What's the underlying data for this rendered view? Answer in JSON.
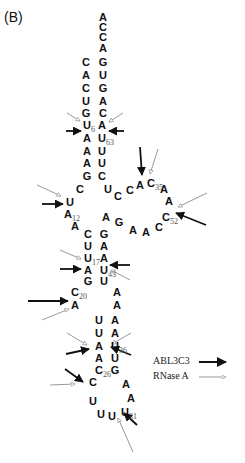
{
  "panel_label": "(B)",
  "legend": {
    "items": [
      {
        "label": "ABL3C3",
        "style": "solid-black-arrow",
        "color": "#111111"
      },
      {
        "label": "RNase A",
        "style": "gray-open-arrow",
        "color": "#999999"
      }
    ]
  },
  "colors": {
    "abl3c3": "#111111",
    "rnase_a": "#999999",
    "nucleotide": "#111111",
    "index": "#555555"
  },
  "nucleotides": [
    {
      "b": "A",
      "x": 103,
      "y": 17
    },
    {
      "b": "C",
      "x": 103,
      "y": 27
    },
    {
      "b": "C",
      "x": 103,
      "y": 37
    },
    {
      "b": "A",
      "x": 103,
      "y": 48
    },
    {
      "b": "G",
      "x": 103,
      "y": 62
    },
    {
      "b": "U",
      "x": 103,
      "y": 75
    },
    {
      "b": "G",
      "x": 103,
      "y": 88
    },
    {
      "b": "A",
      "x": 103,
      "y": 101
    },
    {
      "b": "C",
      "x": 103,
      "y": 113
    },
    {
      "b": "C",
      "x": 86,
      "y": 62
    },
    {
      "b": "A",
      "x": 86,
      "y": 75
    },
    {
      "b": "C",
      "x": 86,
      "y": 88
    },
    {
      "b": "U",
      "x": 86,
      "y": 101
    },
    {
      "b": "G",
      "x": 86,
      "y": 113
    },
    {
      "b": "U",
      "x": 87,
      "y": 125,
      "idx": "6"
    },
    {
      "b": "A",
      "x": 87,
      "y": 138
    },
    {
      "b": "A",
      "x": 87,
      "y": 151
    },
    {
      "b": "A",
      "x": 87,
      "y": 163
    },
    {
      "b": "G",
      "x": 87,
      "y": 176
    },
    {
      "b": "A",
      "x": 102,
      "y": 125
    },
    {
      "b": "U",
      "x": 102,
      "y": 138,
      "idx": "63"
    },
    {
      "b": "U",
      "x": 102,
      "y": 151
    },
    {
      "b": "U",
      "x": 102,
      "y": 163
    },
    {
      "b": "C",
      "x": 102,
      "y": 176
    },
    {
      "b": "C",
      "x": 80,
      "y": 189
    },
    {
      "b": "U",
      "x": 108,
      "y": 189
    },
    {
      "b": "C",
      "x": 118,
      "y": 196
    },
    {
      "b": "C",
      "x": 130,
      "y": 190
    },
    {
      "b": "A",
      "x": 140,
      "y": 185
    },
    {
      "b": "C",
      "x": 151,
      "y": 183,
      "idx": "35"
    },
    {
      "b": "A",
      "x": 164,
      "y": 189
    },
    {
      "b": "A",
      "x": 169,
      "y": 201
    },
    {
      "b": "C",
      "x": 166,
      "y": 217,
      "idx": "52"
    },
    {
      "b": "C",
      "x": 159,
      "y": 227
    },
    {
      "b": "A",
      "x": 146,
      "y": 232
    },
    {
      "b": "A",
      "x": 133,
      "y": 230
    },
    {
      "b": "G",
      "x": 119,
      "y": 222
    },
    {
      "b": "A",
      "x": 106,
      "y": 217
    },
    {
      "b": "U",
      "x": 70,
      "y": 202
    },
    {
      "b": "A",
      "x": 68,
      "y": 214,
      "idx": "12"
    },
    {
      "b": "A",
      "x": 75,
      "y": 226
    },
    {
      "b": "C",
      "x": 88,
      "y": 234
    },
    {
      "b": "U",
      "x": 88,
      "y": 246
    },
    {
      "b": "U",
      "x": 88,
      "y": 258,
      "idx": "17"
    },
    {
      "b": "A",
      "x": 88,
      "y": 270
    },
    {
      "b": "G",
      "x": 88,
      "y": 281
    },
    {
      "b": "C",
      "x": 75,
      "y": 292,
      "idx": "20"
    },
    {
      "b": "A",
      "x": 75,
      "y": 305
    },
    {
      "b": "G",
      "x": 104,
      "y": 234
    },
    {
      "b": "A",
      "x": 104,
      "y": 246
    },
    {
      "b": "A",
      "x": 104,
      "y": 258
    },
    {
      "b": "U",
      "x": 104,
      "y": 270,
      "idx": "43"
    },
    {
      "b": "U",
      "x": 104,
      "y": 281
    },
    {
      "b": "A",
      "x": 117,
      "y": 292
    },
    {
      "b": "A",
      "x": 117,
      "y": 305
    },
    {
      "b": "U",
      "x": 99,
      "y": 320
    },
    {
      "b": "U",
      "x": 99,
      "y": 333
    },
    {
      "b": "A",
      "x": 99,
      "y": 346
    },
    {
      "b": "A",
      "x": 99,
      "y": 358
    },
    {
      "b": "C",
      "x": 99,
      "y": 370,
      "idx": "26"
    },
    {
      "b": "A",
      "x": 115,
      "y": 320
    },
    {
      "b": "A",
      "x": 115,
      "y": 333
    },
    {
      "b": "U",
      "x": 115,
      "y": 346,
      "idx": "36"
    },
    {
      "b": "U",
      "x": 115,
      "y": 358
    },
    {
      "b": "G",
      "x": 115,
      "y": 370
    },
    {
      "b": "C",
      "x": 93,
      "y": 382
    },
    {
      "b": "U",
      "x": 93,
      "y": 401
    },
    {
      "b": "U",
      "x": 101,
      "y": 414
    },
    {
      "b": "U",
      "x": 112,
      "y": 416
    },
    {
      "b": "U",
      "x": 125,
      "y": 412,
      "idx": "31"
    },
    {
      "b": "A",
      "x": 131,
      "y": 398
    },
    {
      "b": "A",
      "x": 126,
      "y": 384
    }
  ],
  "cleavage_arrows": [
    {
      "enzyme": "ABL3C3",
      "site": "U6",
      "x1": 66,
      "y1": 131,
      "x2": 81,
      "y2": 131
    },
    {
      "enzyme": "RNase A",
      "site": "U6",
      "x1": 67,
      "y1": 113,
      "x2": 80,
      "y2": 121
    },
    {
      "enzyme": "ABL3C3",
      "site": "A/U63",
      "x1": 124,
      "y1": 131,
      "x2": 109,
      "y2": 131
    },
    {
      "enzyme": "RNase A",
      "site": "A64",
      "x1": 123,
      "y1": 113,
      "x2": 109,
      "y2": 122
    },
    {
      "enzyme": "ABL3C3",
      "site": "A34",
      "x1": 140,
      "y1": 147,
      "x2": 142,
      "y2": 175
    },
    {
      "enzyme": "RNase A",
      "site": "C35",
      "x1": 158,
      "y1": 149,
      "x2": 150,
      "y2": 174
    },
    {
      "enzyme": "RNase A",
      "site": "A53",
      "x1": 207,
      "y1": 193,
      "x2": 178,
      "y2": 207
    },
    {
      "enzyme": "ABL3C3",
      "site": "C52",
      "x1": 206,
      "y1": 225,
      "x2": 176,
      "y2": 213
    },
    {
      "enzyme": "RNase A",
      "site": "U11",
      "x1": 37,
      "y1": 185,
      "x2": 61,
      "y2": 196
    },
    {
      "enzyme": "ABL3C3",
      "site": "A12",
      "x1": 42,
      "y1": 204,
      "x2": 63,
      "y2": 204
    },
    {
      "enzyme": "RNase A",
      "site": "U17",
      "x1": 60,
      "y1": 250,
      "x2": 81,
      "y2": 259
    },
    {
      "enzyme": "ABL3C3",
      "site": "A18",
      "x1": 60,
      "y1": 269,
      "x2": 81,
      "y2": 269
    },
    {
      "enzyme": "ABL3C3",
      "site": "A42",
      "x1": 130,
      "y1": 265,
      "x2": 110,
      "y2": 265
    },
    {
      "enzyme": "RNase A",
      "site": "U43",
      "x1": 130,
      "y1": 280,
      "x2": 111,
      "y2": 270
    },
    {
      "enzyme": "ABL3C3",
      "site": "C20",
      "x1": 28,
      "y1": 301,
      "x2": 68,
      "y2": 301
    },
    {
      "enzyme": "RNase A",
      "site": "A21",
      "x1": 42,
      "y1": 320,
      "x2": 69,
      "y2": 309
    },
    {
      "enzyme": "RNase A",
      "site": "A24",
      "x1": 67,
      "y1": 333,
      "x2": 87,
      "y2": 345
    },
    {
      "enzyme": "ABL3C3",
      "site": "A24",
      "x1": 66,
      "y1": 354,
      "x2": 89,
      "y2": 349
    },
    {
      "enzyme": "RNase A",
      "site": "A35",
      "x1": 131,
      "y1": 333,
      "x2": 112,
      "y2": 344
    },
    {
      "enzyme": "ABL3C3",
      "site": "U36",
      "x1": 131,
      "y1": 355,
      "x2": 111,
      "y2": 347
    },
    {
      "enzyme": "ABL3C3",
      "site": "C26",
      "x1": 65,
      "y1": 369,
      "x2": 83,
      "y2": 382
    },
    {
      "enzyme": "RNase A",
      "site": "C27",
      "x1": 50,
      "y1": 385,
      "x2": 75,
      "y2": 384
    },
    {
      "enzyme": "ABL3C3",
      "site": "U31",
      "x1": 137,
      "y1": 425,
      "x2": 124,
      "y2": 413
    },
    {
      "enzyme": "RNase A",
      "site": "U31",
      "x1": 133,
      "y1": 452,
      "x2": 118,
      "y2": 418
    }
  ]
}
